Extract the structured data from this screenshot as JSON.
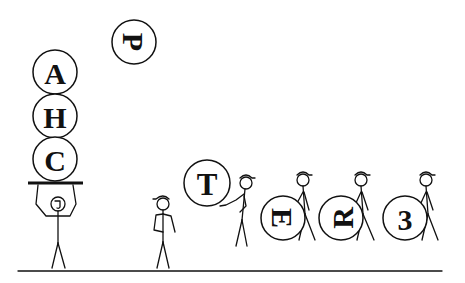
{
  "scene": {
    "ground": {
      "x1": 18,
      "x2": 442,
      "y": 271
    },
    "balls": [
      {
        "id": "ball-p",
        "letter": "P",
        "cx": 134,
        "cy": 42,
        "r": 22,
        "rotate": 90
      },
      {
        "id": "ball-a",
        "letter": "A",
        "cx": 55,
        "cy": 72,
        "r": 22,
        "rotate": 0
      },
      {
        "id": "ball-h",
        "letter": "H",
        "cx": 55,
        "cy": 116,
        "r": 22,
        "rotate": 0
      },
      {
        "id": "ball-c",
        "letter": "C",
        "cx": 55,
        "cy": 159,
        "r": 22,
        "rotate": 0
      },
      {
        "id": "ball-t",
        "letter": "T",
        "cx": 207,
        "cy": 183,
        "r": 23,
        "rotate": 0
      },
      {
        "id": "ball-e",
        "letter": "E",
        "cx": 283,
        "cy": 218,
        "r": 22,
        "rotate": 90
      },
      {
        "id": "ball-r",
        "letter": "R",
        "cx": 341,
        "cy": 218,
        "r": 22,
        "rotate": -90
      },
      {
        "id": "ball-3",
        "letter": "3",
        "cx": 405,
        "cy": 218,
        "r": 22,
        "rotate": 0
      }
    ]
  }
}
